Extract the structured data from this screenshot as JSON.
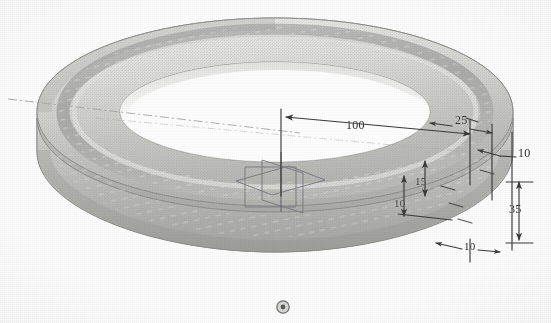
{
  "view": {
    "title": "Ring / Torus Part — Dimensioned 3D View",
    "background_color": "#fdfdfd",
    "render_style": "shaded-grayscale-wireframe",
    "part_name": "ring",
    "units_note": ""
  },
  "model": {
    "shape": "torus-ring",
    "surface_color_light": "#e8e8e6",
    "surface_color_mid": "#c9c9c6",
    "surface_color_dark": "#a9a9a6",
    "outline_color": "#8f8f8c",
    "inner_hole_color": "#ffffff"
  },
  "annotations": {
    "line_color": "#3a3a3a",
    "text_color": "#2e2e2e",
    "dimensions": [
      {
        "id": "dim-100",
        "label": "100",
        "orientation": "horizontal",
        "note": "overall radius span across top face"
      },
      {
        "id": "dim-25",
        "label": "25",
        "orientation": "horizontal",
        "note": "outer rim band width"
      },
      {
        "id": "dim-10-right",
        "label": "10",
        "orientation": "horizontal",
        "note": "outer edge thickness, leader to right"
      },
      {
        "id": "dim-15",
        "label": "15",
        "orientation": "vertical",
        "note": "upper step height"
      },
      {
        "id": "dim-10-mid",
        "label": "10",
        "orientation": "vertical",
        "note": "lower step height"
      },
      {
        "id": "dim-35",
        "label": "35",
        "orientation": "vertical",
        "note": "overall section height at right"
      },
      {
        "id": "dim-10-bottom",
        "label": "10",
        "orientation": "horizontal",
        "note": "bottom flange width"
      }
    ]
  },
  "widgets": {
    "origin_triad": {
      "name": "coordinate-planes-widget",
      "color": "#7a7a86",
      "description": "three intersecting construction planes at model origin"
    },
    "axis_line": {
      "name": "center-axis",
      "style": "dash-dot",
      "color": "#9a9a9a"
    },
    "bottom_marker": {
      "name": "rotation-center-marker",
      "glyph": "◎",
      "color": "#6e6e6e"
    }
  }
}
